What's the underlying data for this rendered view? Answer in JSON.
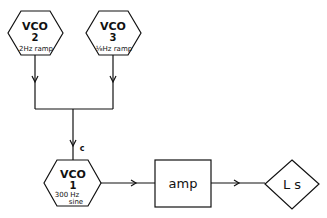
{
  "nodes": {
    "vco2": {
      "title": "VCO",
      "number": "2",
      "detail": "2Hz ramp"
    },
    "vco3": {
      "title": "VCO",
      "number": "3",
      "detail": "⅛Hz ramp"
    },
    "vco1": {
      "title": "VCO",
      "number": "1",
      "detail_top": "300 Hz",
      "detail_bottom": "sine"
    },
    "amp": {
      "label": "amp"
    },
    "ls": {
      "label": "L s"
    }
  },
  "edges": {
    "junction_label": "c"
  },
  "colors": {
    "stroke": "#111111",
    "background": "#ffffff"
  }
}
